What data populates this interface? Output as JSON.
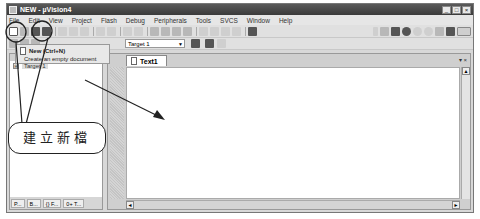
{
  "window": {
    "title": "NEW - µVision4",
    "controls": [
      "_",
      "□",
      "×"
    ]
  },
  "menubar": {
    "items": [
      "File",
      "Edit",
      "View",
      "Project",
      "Flash",
      "Debug",
      "Peripherals",
      "Tools",
      "SVCS",
      "Window",
      "Help"
    ]
  },
  "toolbar2": {
    "target_value": "Target 1"
  },
  "tooltip": {
    "title": "New (Ctrl+N)",
    "description": "Create an empty document"
  },
  "project_tree": {
    "expander": "⊞",
    "root": "Target 1"
  },
  "left_tabs": [
    "P...",
    "B...",
    "{} F...",
    "0+ T..."
  ],
  "editor": {
    "tab_label": "Text1",
    "pane_controls": "▾ ×"
  },
  "annotation": {
    "callout_text": "建立新檔"
  }
}
